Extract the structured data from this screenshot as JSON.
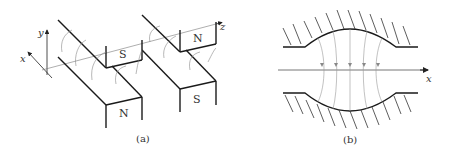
{
  "figure_a": {
    "caption": "(a)",
    "axes": {
      "x": "x",
      "y": "y",
      "z": "z"
    },
    "poles": [
      {
        "label": "S",
        "position": "front-top"
      },
      {
        "label": "N",
        "position": "front-bottom"
      },
      {
        "label": "N",
        "position": "back-top"
      },
      {
        "label": "S",
        "position": "back-bottom"
      }
    ]
  },
  "figure_b": {
    "caption": "(b)",
    "axis": "x"
  },
  "colors": {
    "line": "#1a1a1a",
    "field_line": "#888888",
    "axis_line": "#777777"
  }
}
